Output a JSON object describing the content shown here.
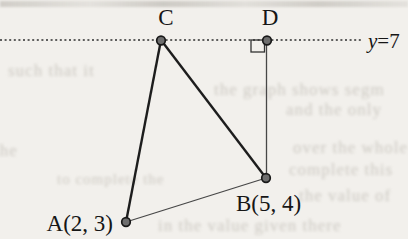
{
  "figure": {
    "type": "geometry-diagram",
    "horizontal_line": {
      "label_var": "y",
      "label_rest": "=7",
      "full_label": "y=7",
      "style": "dotted"
    },
    "points": {
      "A": {
        "label": "A(2, 3)"
      },
      "B": {
        "label": "B(5, 4)"
      },
      "C": {
        "label": "C"
      },
      "D": {
        "label": "D"
      }
    },
    "segments": [
      "CA",
      "CB",
      "AB",
      "DB"
    ],
    "right_angle_at": "D",
    "colors": {
      "paper": "#f2f0ec",
      "ink": "#1d1d1d",
      "thin_line": "#474747",
      "point_fill": "#6e6e6e"
    }
  },
  "bleed_through": {
    "fragments": [
      "the graph shows segm",
      "and the only",
      "such that it",
      "the",
      "over the whole",
      "complete this",
      "the value of",
      "to complete the",
      "in the value given there"
    ]
  }
}
